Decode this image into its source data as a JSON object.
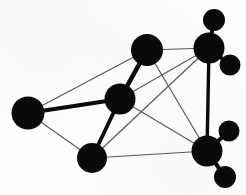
{
  "figure": {
    "background_color": "#fdfdfd",
    "node_color": "#0a0a0a",
    "bond_thick_color": "#0a0a0a",
    "bond_thin_color": "#5a5a5a",
    "width": 246,
    "height": 195
  },
  "chart_data": {
    "type": "diagram",
    "xlabel": "",
    "ylabel": "",
    "xlim": [
      0,
      246
    ],
    "ylim": [
      0,
      195
    ],
    "grid": false,
    "legend": false,
    "nodes": [
      {
        "id": "left",
        "label": "",
        "x": 28,
        "y": 113,
        "r": 16.5,
        "kind": "primary"
      },
      {
        "id": "center",
        "label": "",
        "x": 120,
        "y": 99,
        "r": 15.5,
        "kind": "primary"
      },
      {
        "id": "top-middle",
        "label": "",
        "x": 147,
        "y": 50,
        "r": 16.0,
        "kind": "primary"
      },
      {
        "id": "bottom-middle",
        "label": "",
        "x": 92,
        "y": 158,
        "r": 15.0,
        "kind": "primary"
      },
      {
        "id": "upper-right",
        "label": "",
        "x": 209,
        "y": 48,
        "r": 15.5,
        "kind": "primary"
      },
      {
        "id": "lower-right",
        "label": "",
        "x": 207,
        "y": 151,
        "r": 15.5,
        "kind": "primary"
      },
      {
        "id": "ur-satellite-a",
        "label": "",
        "x": 214,
        "y": 20,
        "r": 11.0,
        "kind": "satellite"
      },
      {
        "id": "ur-satellite-b",
        "label": "",
        "x": 230,
        "y": 65,
        "r": 10.5,
        "kind": "satellite"
      },
      {
        "id": "lr-satellite-a",
        "label": "",
        "x": 229,
        "y": 131,
        "r": 10.5,
        "kind": "satellite"
      },
      {
        "id": "lr-satellite-b",
        "label": "",
        "x": 225,
        "y": 177,
        "r": 11.0,
        "kind": "satellite"
      }
    ],
    "bonds_thick": [
      {
        "from": "left",
        "to": "center",
        "width": 4.2
      },
      {
        "from": "center",
        "to": "top-middle",
        "width": 4.6
      },
      {
        "from": "center",
        "to": "bottom-middle",
        "width": 3.8
      },
      {
        "from": "upper-right",
        "to": "ur-satellite-a",
        "width": 4.0
      },
      {
        "from": "upper-right",
        "to": "ur-satellite-b",
        "width": 4.0
      },
      {
        "from": "lower-right",
        "to": "lr-satellite-a",
        "width": 4.0
      },
      {
        "from": "lower-right",
        "to": "lr-satellite-b",
        "width": 4.0
      },
      {
        "from": "upper-right",
        "to": "lower-right",
        "width": 3.4
      }
    ],
    "bonds_thin": [
      {
        "from": "left",
        "to": "top-middle",
        "width": 1.2
      },
      {
        "from": "left",
        "to": "bottom-middle",
        "width": 1.2
      },
      {
        "from": "top-middle",
        "to": "lower-right",
        "width": 1.2
      },
      {
        "from": "bottom-middle",
        "to": "upper-right",
        "width": 1.2
      },
      {
        "from": "center",
        "to": "upper-right",
        "width": 1.2
      },
      {
        "from": "center",
        "to": "lower-right",
        "width": 1.2
      },
      {
        "from": "top-middle",
        "to": "upper-right",
        "width": 1.2
      },
      {
        "from": "bottom-middle",
        "to": "lower-right",
        "width": 1.2
      }
    ]
  }
}
